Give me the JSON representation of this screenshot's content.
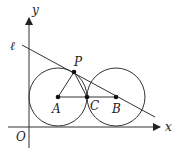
{
  "diagram": {
    "type": "geometry",
    "labels": {
      "y_axis": "y",
      "x_axis": "x",
      "origin": "O",
      "line": "ℓ",
      "point_p": "P",
      "point_a": "A",
      "point_b": "B",
      "point_c": "C"
    },
    "colors": {
      "stroke": "#333333",
      "text": "#222222",
      "background": "#ffffff"
    }
  }
}
